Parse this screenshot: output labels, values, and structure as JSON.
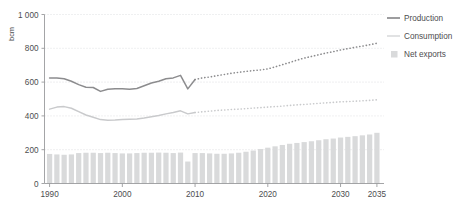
{
  "chart_data": {
    "type": "line",
    "title": "",
    "subtitle": "",
    "xlabel": "",
    "ylabel": "bcm",
    "xlim": [
      1989.3,
      2035.7
    ],
    "ylim": [
      0,
      1000
    ],
    "grid": true,
    "legend_position": "right",
    "x_ticks": [
      "1990",
      "2000",
      "2010",
      "2020",
      "2030",
      "2035"
    ],
    "x_tick_values": [
      1990,
      2000,
      2010,
      2020,
      2030,
      2035
    ],
    "y_ticks": [
      "0",
      "200",
      "400",
      "600",
      "800",
      "1 000"
    ],
    "y_tick_values": [
      0,
      200,
      400,
      600,
      800,
      1000
    ],
    "projection_start_year": 2010,
    "x": [
      1990,
      1991,
      1992,
      1993,
      1994,
      1995,
      1996,
      1997,
      1998,
      1999,
      2000,
      2001,
      2002,
      2003,
      2004,
      2005,
      2006,
      2007,
      2008,
      2009,
      2010,
      2011,
      2012,
      2013,
      2014,
      2015,
      2016,
      2017,
      2018,
      2019,
      2020,
      2021,
      2022,
      2023,
      2024,
      2025,
      2026,
      2027,
      2028,
      2029,
      2030,
      2031,
      2032,
      2033,
      2034,
      2035
    ],
    "series": [
      {
        "name": "Production",
        "color": "#8c8c8e",
        "style": "line",
        "historical_style": "solid",
        "projection_style": "dotted",
        "values": [
          625,
          625,
          620,
          605,
          585,
          570,
          568,
          545,
          558,
          560,
          560,
          558,
          562,
          578,
          595,
          605,
          620,
          625,
          640,
          560,
          615,
          625,
          630,
          638,
          645,
          652,
          658,
          663,
          668,
          672,
          678,
          690,
          703,
          716,
          730,
          742,
          752,
          762,
          772,
          780,
          790,
          798,
          806,
          813,
          821,
          830
        ]
      },
      {
        "name": "Consumption",
        "color": "#c9cacc",
        "style": "line",
        "historical_style": "solid",
        "projection_style": "dotted",
        "values": [
          440,
          452,
          455,
          445,
          425,
          405,
          392,
          378,
          375,
          376,
          378,
          380,
          382,
          388,
          395,
          402,
          412,
          420,
          430,
          412,
          420,
          424,
          428,
          432,
          435,
          438,
          440,
          443,
          446,
          449,
          452,
          455,
          458,
          462,
          465,
          468,
          471,
          474,
          477,
          480,
          483,
          485,
          487,
          489,
          492,
          495
        ]
      }
    ],
    "bar_series": {
      "name": "Net exports",
      "color": "#d9dadb",
      "values": [
        175,
        172,
        170,
        172,
        180,
        182,
        182,
        180,
        182,
        180,
        178,
        178,
        180,
        182,
        182,
        183,
        182,
        180,
        183,
        130,
        180,
        180,
        178,
        176,
        176,
        178,
        182,
        188,
        195,
        204,
        212,
        220,
        228,
        235,
        240,
        245,
        250,
        256,
        262,
        266,
        272,
        276,
        280,
        285,
        290,
        300
      ]
    }
  },
  "legend": {
    "items": [
      {
        "label": "Production",
        "marker": "line-dark",
        "color": "#8c8c8e"
      },
      {
        "label": "Consumption",
        "marker": "line-light",
        "color": "#c9cacc"
      },
      {
        "label": "Net exports",
        "marker": "square",
        "color": "#d9dadb"
      }
    ]
  }
}
